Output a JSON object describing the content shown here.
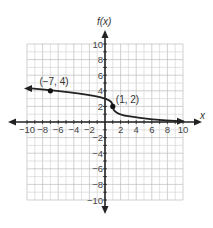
{
  "chart_data": {
    "type": "line",
    "title": "",
    "xlabel": "x",
    "ylabel": "f(x)",
    "xlim": [
      -10,
      10
    ],
    "ylim": [
      -10,
      10
    ],
    "grid": true,
    "grid_step": 1,
    "x_ticks": [
      -10,
      -8,
      -6,
      -4,
      -2,
      2,
      4,
      6,
      8,
      10
    ],
    "y_ticks": [
      10,
      8,
      6,
      4,
      2,
      -2,
      -4,
      -6,
      -8,
      -10
    ],
    "x_tick_labels": [
      "−10",
      "−8",
      "−6",
      "−4",
      "−2",
      "2",
      "4",
      "6",
      "8",
      "10"
    ],
    "y_tick_labels": [
      "10",
      "8",
      "6",
      "4",
      "2",
      "−2",
      "−4",
      "−6",
      "−8",
      "−10"
    ],
    "series": [
      {
        "name": "f(x)",
        "description": "decreasing curve, arrow to the left approaching ~4.4, passes through (-7,4) and (1,2), vertical tangent near (1,2), then decays toward 0 with arrow to the right",
        "x": [
          -10,
          -8,
          -7,
          -6,
          -4,
          -2,
          0,
          0.5,
          1,
          1.5,
          2,
          3,
          4,
          6,
          8,
          10
        ],
        "y": [
          4.3,
          4.1,
          4,
          3.9,
          3.7,
          3.4,
          3.0,
          2.7,
          2,
          1.4,
          1.1,
          0.8,
          0.6,
          0.35,
          0.2,
          0.1
        ]
      }
    ],
    "annotations": [
      {
        "label": "(−7, 4)",
        "x": -7,
        "y": 4
      },
      {
        "label": "(1, 2)",
        "x": 1,
        "y": 2
      }
    ]
  }
}
